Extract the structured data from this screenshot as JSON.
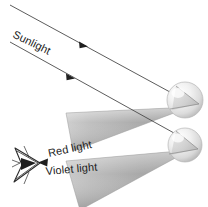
{
  "figure": {
    "type": "optics-diagram",
    "title_visible": false,
    "background_color": "#ffffff",
    "width": 208,
    "height": 207
  },
  "labels": {
    "sunlight": "Sunlight",
    "red_light": "Red light",
    "violet_light": "Violet light"
  },
  "colors": {
    "ray_stroke": "#4a4a4a",
    "text": "#1a1a1a",
    "cone_light": "#d8d8d8",
    "cone_mid": "#b0b0b0",
    "cone_dark": "#8e8e8e",
    "drop_highlight": "#fbfbfb",
    "drop_shade": "#b9b9b9",
    "drop_outline": "#b4b4b4",
    "eye_stroke": "#2b2b2b"
  },
  "elements": {
    "sun_ray_upper": {
      "name": "sunlight-ray-upper",
      "x1": 10,
      "y1": 5,
      "x2": 186,
      "y2": 101,
      "arrow_at": {
        "x": 83,
        "y": 44
      }
    },
    "sun_ray_lower": {
      "name": "sunlight-ray-lower",
      "x1": 10,
      "y1": 42,
      "x2": 186,
      "y2": 140,
      "arrow_at": {
        "x": 71,
        "y": 76
      }
    },
    "raindrop_upper": {
      "cx": 185,
      "cy": 100,
      "r": 18
    },
    "raindrop_lower": {
      "cx": 185,
      "cy": 145,
      "r": 17
    },
    "red_cone": {
      "apex": {
        "x": 190,
        "y": 107
      },
      "base_top": {
        "x": 66,
        "y": 113
      },
      "base_bottom": {
        "x": 73,
        "y": 151
      }
    },
    "violet_cone": {
      "apex": {
        "x": 190,
        "y": 150
      },
      "base_top": {
        "x": 66,
        "y": 161
      },
      "base_bottom": {
        "x": 78,
        "y": 207
      }
    },
    "eye": {
      "cx": 30,
      "cy": 165
    },
    "eye_arrow": {
      "x": 39,
      "y": 162
    }
  },
  "label_positions": {
    "sunlight": {
      "x": 12,
      "y": 37,
      "rotate": 26
    },
    "red_light": {
      "x": 48,
      "y": 157,
      "rotate": -12
    },
    "violet_light": {
      "x": 45,
      "y": 175,
      "rotate": -5
    }
  }
}
